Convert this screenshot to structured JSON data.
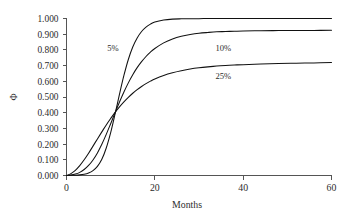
{
  "chart_data": {
    "type": "line",
    "title": "",
    "subtitle": "",
    "xlabel": "Months",
    "ylabel": "Φ",
    "xlim": [
      0,
      60
    ],
    "ylim": [
      0,
      1.0
    ],
    "grid": false,
    "legend_position": "inline-annotations",
    "x_ticks": [
      0,
      20,
      40,
      60
    ],
    "x_tick_labels": [
      "0",
      "20",
      "40",
      "60"
    ],
    "y_ticks": [
      0.0,
      0.1,
      0.2,
      0.3,
      0.4,
      0.5,
      0.6,
      0.7,
      0.8,
      0.9,
      1.0
    ],
    "y_tick_labels": [
      "0.000",
      "0.100",
      "0.200",
      "0.300",
      "0.400",
      "0.500",
      "0.600",
      "0.700",
      "0.800",
      "0.900",
      "1.000"
    ],
    "crossing_point": {
      "x": 15,
      "y": 0.5
    },
    "annotations": [
      {
        "text": "5%",
        "x": 10.5,
        "y": 0.79
      },
      {
        "text": "10%",
        "x": 35.5,
        "y": 0.79
      },
      {
        "text": "25%",
        "x": 35.5,
        "y": 0.615
      }
    ],
    "x": [
      0,
      1,
      2,
      3,
      4,
      5,
      6,
      7,
      8,
      9,
      10,
      11,
      12,
      13,
      14,
      15,
      16,
      17,
      18,
      19,
      20,
      22,
      24,
      26,
      28,
      30,
      32,
      34,
      36,
      38,
      40,
      44,
      48,
      52,
      56,
      60
    ],
    "series": [
      {
        "name": "5%",
        "label": "5%",
        "color": "#111111",
        "plateau": 1.0,
        "values": [
          0.0,
          0.001,
          0.002,
          0.004,
          0.008,
          0.016,
          0.031,
          0.058,
          0.103,
          0.175,
          0.273,
          0.392,
          0.518,
          0.637,
          0.739,
          0.818,
          0.876,
          0.917,
          0.945,
          0.964,
          0.977,
          0.99,
          0.996,
          0.998,
          0.999,
          0.999,
          1.0,
          1.0,
          1.0,
          1.0,
          1.0,
          1.0,
          1.0,
          1.0,
          1.0,
          1.0
        ]
      },
      {
        "name": "10%",
        "label": "10%",
        "color": "#111111",
        "plateau": 0.925,
        "values": [
          0.0,
          0.003,
          0.009,
          0.02,
          0.038,
          0.064,
          0.099,
          0.144,
          0.199,
          0.262,
          0.33,
          0.4,
          0.468,
          0.532,
          0.59,
          0.642,
          0.687,
          0.725,
          0.758,
          0.786,
          0.809,
          0.845,
          0.87,
          0.887,
          0.898,
          0.906,
          0.911,
          0.915,
          0.917,
          0.919,
          0.92,
          0.922,
          0.923,
          0.924,
          0.924,
          0.925
        ]
      },
      {
        "name": "25%",
        "label": "25%",
        "color": "#111111",
        "plateau": 0.72,
        "values": [
          0.0,
          0.012,
          0.033,
          0.063,
          0.1,
          0.142,
          0.187,
          0.233,
          0.278,
          0.322,
          0.363,
          0.402,
          0.437,
          0.469,
          0.498,
          0.524,
          0.547,
          0.567,
          0.585,
          0.601,
          0.615,
          0.637,
          0.654,
          0.667,
          0.678,
          0.686,
          0.692,
          0.697,
          0.701,
          0.704,
          0.706,
          0.71,
          0.713,
          0.715,
          0.717,
          0.72
        ]
      }
    ]
  }
}
